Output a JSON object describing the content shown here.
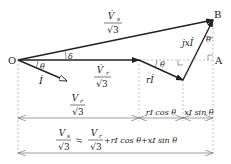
{
  "diagram": {
    "points": {
      "origin": "O",
      "top_right": "B",
      "right": "A"
    },
    "vectors": {
      "vs": {
        "num": "V̇",
        "sub": "s",
        "den": "√3"
      },
      "vr": {
        "num": "V̇",
        "sub": "r",
        "den": "√3"
      },
      "current": "İ",
      "ri": "rİ",
      "jxi": "jxİ"
    },
    "angles": {
      "delta": "δ",
      "theta_origin": "θ",
      "theta_ri": "θ",
      "theta_b": "θ"
    },
    "dimensions": {
      "vr_span": {
        "num": "V",
        "sub": "r",
        "den": "√3"
      },
      "ricos": "rI cos θ",
      "xisin": "xI sin θ",
      "total_lhs": {
        "num": "V",
        "sub": "s",
        "den": "√3"
      },
      "approx": "≒",
      "total_rhs": {
        "num": "V",
        "sub": "r",
        "den": "√3"
      },
      "total_tail": "+rI cos θ+xI sin θ"
    },
    "colors": {
      "line": "#222222",
      "dash": "#999999"
    }
  }
}
